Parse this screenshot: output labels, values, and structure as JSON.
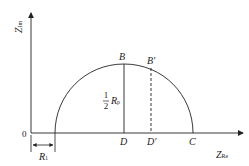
{
  "diagram": {
    "type": "Nyquist plot (semicircle impedance)",
    "axes": {
      "y_label_main": "Z",
      "y_label_sub": "Im",
      "x_label_main": "Z",
      "x_label_sub": "Re",
      "origin_label": "0"
    },
    "points": {
      "B": "B",
      "B_prime": "B′",
      "D": "D",
      "D_prime": "D′",
      "C": "C"
    },
    "annotations": {
      "half_num": "1",
      "half_den": "2",
      "rp_main": "R",
      "rp_sub": "p",
      "r1_main": "R",
      "r1_sub": "1"
    },
    "colors": {
      "line": "#222222",
      "background": "#ffffff"
    }
  }
}
